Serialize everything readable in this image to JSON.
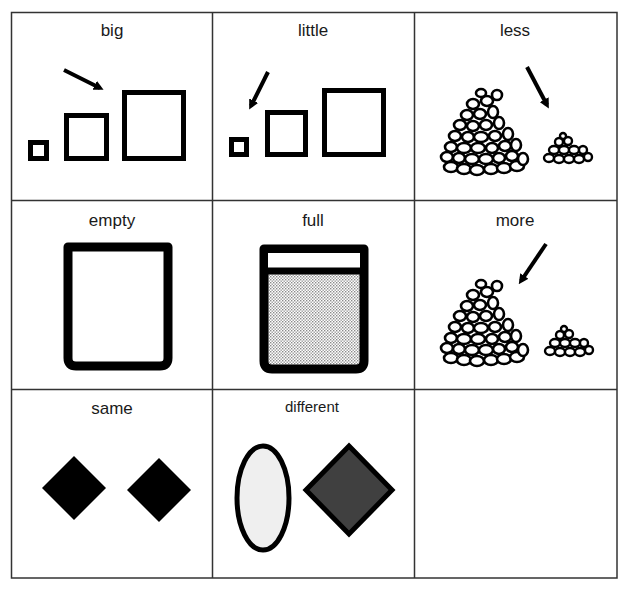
{
  "document": {
    "title": "Concept vocabulary picture cards",
    "grid": {
      "rows": 3,
      "columns": 3,
      "line_color": "#333333"
    },
    "cells": [
      {
        "row": 0,
        "col": 0,
        "label": "big",
        "picture": "three squares increasing in size, arrow pointing to the biggest square"
      },
      {
        "row": 0,
        "col": 1,
        "label": "little",
        "picture": "three squares increasing in size, arrow pointing to the smallest square"
      },
      {
        "row": 0,
        "col": 2,
        "label": "less",
        "picture": "large pile and small pile of pebbles, arrow pointing to the small pile"
      },
      {
        "row": 1,
        "col": 0,
        "label": "empty",
        "picture": "empty container outline"
      },
      {
        "row": 1,
        "col": 1,
        "label": "full",
        "picture": "container filled with stippled contents"
      },
      {
        "row": 1,
        "col": 2,
        "label": "more",
        "picture": "large pile and small pile of pebbles, arrow pointing to the large pile"
      },
      {
        "row": 2,
        "col": 0,
        "label": "same",
        "picture": "two identical black diamonds"
      },
      {
        "row": 2,
        "col": 1,
        "label": "different",
        "picture": "light gray oval and dark gray diamond"
      },
      {
        "row": 2,
        "col": 2,
        "label": "",
        "picture": ""
      }
    ],
    "colors": {
      "ink": "#000000",
      "oval_fill": "#efefef",
      "diamond_dark_fill": "#404040",
      "stipple_fill": "#d9d9d9"
    }
  }
}
